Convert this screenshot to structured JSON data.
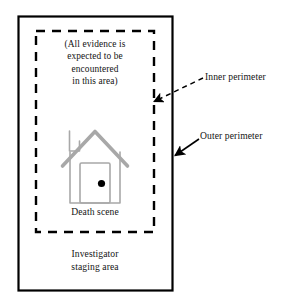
{
  "diagram": {
    "outer_perimeter": {
      "label": "Outer perimeter",
      "style": "solid",
      "stroke_color": "#000000"
    },
    "inner_perimeter": {
      "label": "Inner perimeter",
      "style": "dashed",
      "stroke_color": "#000000"
    },
    "evidence_note": "(All evidence is\nexpected to be\nencountered\nin this area)",
    "death_scene_label": "Death scene",
    "staging_area_label": "Investigator\nstaging area",
    "house_icon": {
      "name": "house-icon",
      "stroke_color": "#a8a8a8",
      "doorknob_color": "#000000"
    }
  }
}
